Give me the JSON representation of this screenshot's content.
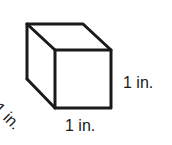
{
  "figure": {
    "shape": "cube",
    "stroke_color": "#1a1a1a",
    "background_color": "#ffffff",
    "labels": {
      "height": "1 in.",
      "width": "1 in.",
      "depth": "1 in."
    }
  }
}
